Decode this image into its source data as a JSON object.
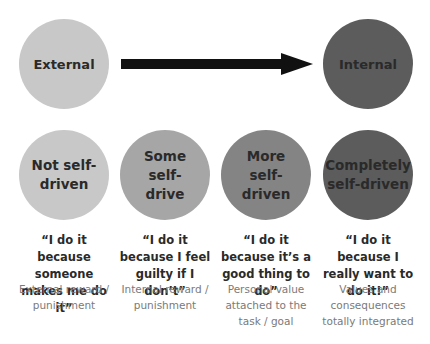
{
  "top_row": {
    "left": {
      "label": "External",
      "color": "#c8c8c8"
    },
    "right": {
      "label": "Internal",
      "color": "#5c5c5c"
    },
    "arrow": {
      "direction": "right",
      "color": "#111111"
    }
  },
  "stages": [
    {
      "label": "Not self-driven",
      "color": "#c8c8c8",
      "quote": "“I do it because someone makes me do it”",
      "description": "External reward / punishment"
    },
    {
      "label": "Some self-drive",
      "color": "#a6a6a6",
      "quote": "“I do it because I feel guilty if I don’t”",
      "description": "Internal reward / punishment"
    },
    {
      "label": "More self-driven",
      "color": "#848484",
      "quote": "“I do it because it’s a good thing to do”",
      "description": "Personal value attached to the task / goal"
    },
    {
      "label": "Completely self-driven",
      "color": "#5c5c5c",
      "quote": "“I do it because I really want to do it!”",
      "description": "Values and consequences totally integrated"
    }
  ]
}
